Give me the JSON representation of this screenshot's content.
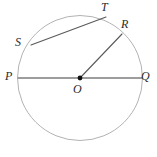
{
  "figure": {
    "type": "geometry-diagram",
    "width": 157,
    "height": 157,
    "background_color": "#ffffff"
  },
  "colors": {
    "circle_stroke": "#b3b3b3",
    "diameter_stroke": "#9d9d9d",
    "chord_stroke": "#5a5a5a",
    "radius_stroke": "#5a5a5a",
    "center_dot": "#111111",
    "label_color": "#2b2b2b"
  },
  "circle": {
    "center_x": 80,
    "center_y": 78,
    "radius": 62.5,
    "stroke_width": 1
  },
  "center_point": {
    "label": "O",
    "x": 80,
    "y": 78,
    "dot_radius": 2.4,
    "label_x": 73,
    "label_y": 83
  },
  "points": [
    {
      "name": "P",
      "label": "P",
      "x": 17.5,
      "y": 78,
      "label_x": 5,
      "label_y": 70
    },
    {
      "name": "Q",
      "label": "Q",
      "x": 142.5,
      "y": 78,
      "label_x": 141,
      "label_y": 70
    },
    {
      "name": "S",
      "label": "S",
      "x": 31,
      "y": 45,
      "label_x": 15,
      "label_y": 36
    },
    {
      "name": "T",
      "label": "T",
      "x": 106,
      "y": 17,
      "label_x": 101,
      "label_y": 1
    },
    {
      "name": "R",
      "label": "R",
      "x": 122,
      "y": 34,
      "label_x": 121,
      "label_y": 18
    }
  ],
  "segments": [
    {
      "name": "diameter-pq",
      "from": "P",
      "to": "Q",
      "x1": 17.5,
      "y1": 78,
      "x2": 142.5,
      "y2": 78,
      "stroke": "#9d9d9d",
      "stroke_width": 2.2
    },
    {
      "name": "chord-st",
      "from": "S",
      "to": "T",
      "x1": 31,
      "y1": 45,
      "x2": 106,
      "y2": 17,
      "stroke": "#5a5a5a",
      "stroke_width": 1.1
    },
    {
      "name": "radius-or",
      "from": "O",
      "to": "R",
      "x1": 80,
      "y1": 78,
      "x2": 122,
      "y2": 34,
      "stroke": "#5a5a5a",
      "stroke_width": 1.1
    }
  ]
}
